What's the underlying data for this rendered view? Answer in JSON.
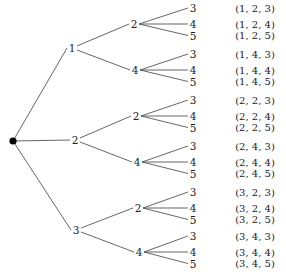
{
  "tree": {
    "root": {
      "label": ""
    },
    "branches": [
      {
        "label": "1",
        "children": [
          {
            "label": "2",
            "leaves": [
              "3",
              "4",
              "5"
            ],
            "outcomes": [
              "(1, 2, 3)",
              "(1, 2, 4)",
              "(1, 2, 5)"
            ]
          },
          {
            "label": "4",
            "leaves": [
              "3",
              "4",
              "5"
            ],
            "outcomes": [
              "(1, 4, 3)",
              "(1, 4, 4)",
              "(1, 4, 5)"
            ]
          }
        ]
      },
      {
        "label": "2",
        "children": [
          {
            "label": "2",
            "leaves": [
              "3",
              "4",
              "5"
            ],
            "outcomes": [
              "(2, 2, 3)",
              "(2, 2, 4)",
              "(2, 2, 5)"
            ]
          },
          {
            "label": "4",
            "leaves": [
              "3",
              "4",
              "5"
            ],
            "outcomes": [
              "(2, 4, 3)",
              "(2, 4, 4)",
              "(2, 4, 5)"
            ]
          }
        ]
      },
      {
        "label": "3",
        "children": [
          {
            "label": "2",
            "leaves": [
              "3",
              "4",
              "5"
            ],
            "outcomes": [
              "(3, 2, 3)",
              "(3, 2, 4)",
              "(3, 2, 5)"
            ]
          },
          {
            "label": "4",
            "leaves": [
              "3",
              "4",
              "5"
            ],
            "outcomes": [
              "(3, 4, 3)",
              "(3, 4, 4)",
              "(3, 4, 5)"
            ]
          }
        ]
      }
    ]
  }
}
